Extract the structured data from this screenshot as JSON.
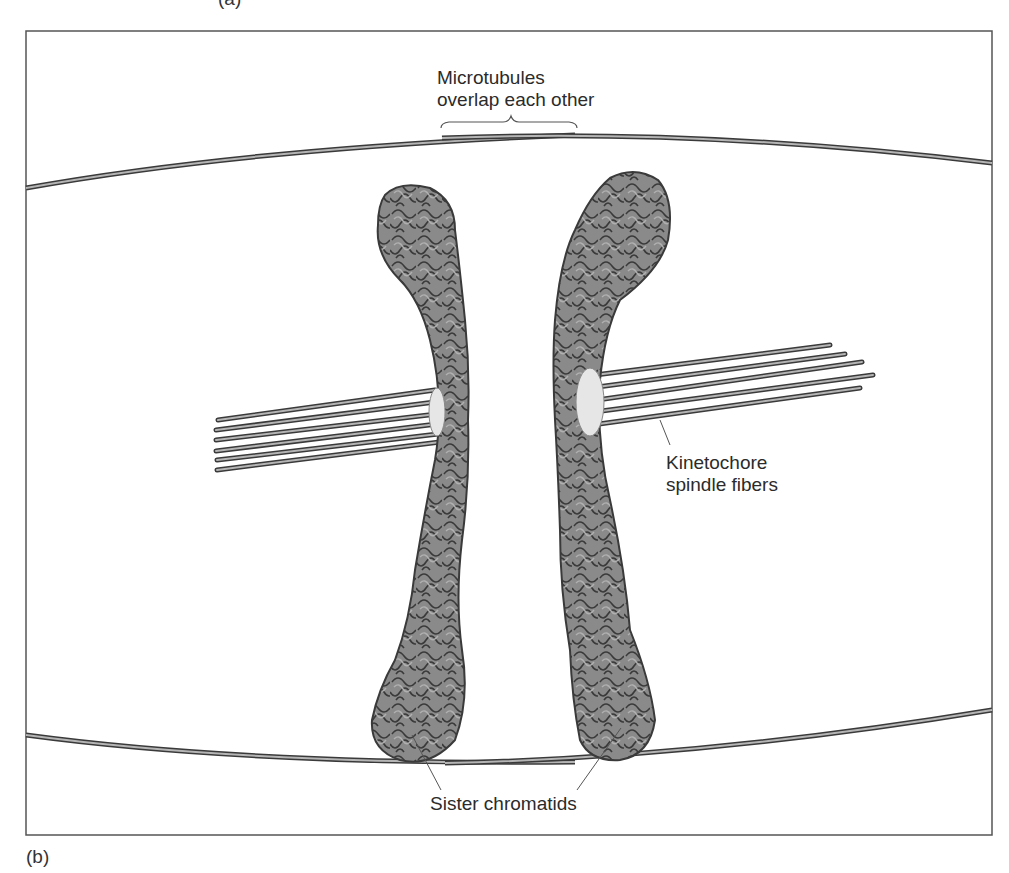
{
  "figure": {
    "panel_label_top": "(a)",
    "panel_label": "(b)",
    "frame": {
      "left": 26,
      "top": 31,
      "right": 992,
      "bottom": 835
    },
    "colors": {
      "chromatid_fill": "#8a8a8a",
      "chromatid_outline": "#3a3a3a",
      "fiber_dark": "#3a3a3a",
      "fiber_light": "#b5b5b5",
      "kinetochore": "#e6e6e6",
      "frame": "#555555"
    }
  },
  "labels": {
    "microtubules_line1": "Microtubules",
    "microtubules_line2": "overlap each other",
    "kinetochore_line1": "Kinetochore",
    "kinetochore_line2": "spindle fibers",
    "sister_chromatids": "Sister chromatids"
  }
}
